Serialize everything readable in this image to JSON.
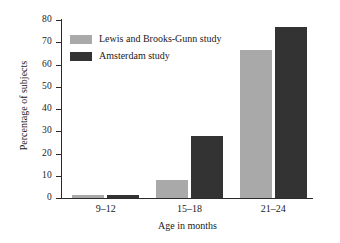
{
  "chart_data": {
    "type": "bar",
    "title": "",
    "subtitle": "",
    "xlabel": "Age in months",
    "ylabel": "Percentage of subjects",
    "categories": [
      "9–12",
      "15–18",
      "21–24"
    ],
    "series": [
      {
        "name": "Lewis and Brooks-Gunn study",
        "color": "#a9a9a9",
        "values": [
          1.5,
          8,
          66.5
        ]
      },
      {
        "name": "Amsterdam study",
        "color": "#333333",
        "values": [
          1.5,
          28,
          77
        ]
      }
    ],
    "ylim": [
      0,
      80
    ],
    "yticks": [
      0,
      10,
      20,
      30,
      40,
      50,
      60,
      70,
      80
    ],
    "ytick_labels": [
      "0",
      "10",
      "20",
      "30",
      "40",
      "50",
      "60",
      "70",
      "80"
    ],
    "grid": false,
    "legend_position": "upper-left-inside",
    "axis_color": "#2b2b2b",
    "background": "#ffffff"
  },
  "legend": {
    "entries": [
      {
        "label": "Lewis and Brooks-Gunn study",
        "color": "#a9a9a9"
      },
      {
        "label": "Amsterdam study",
        "color": "#333333"
      }
    ]
  }
}
